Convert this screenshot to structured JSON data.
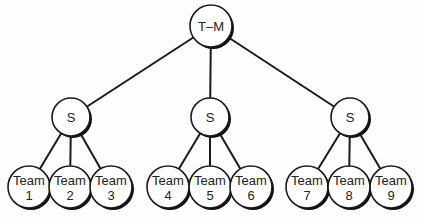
{
  "diagram": {
    "type": "tree",
    "root": {
      "id": "tm",
      "label": "T–M",
      "x": 211,
      "y": 26,
      "r": 21
    },
    "supervisors": [
      {
        "id": "s1",
        "label": "S",
        "x": 71,
        "y": 117,
        "r": 19
      },
      {
        "id": "s2",
        "label": "S",
        "x": 210,
        "y": 117,
        "r": 19
      },
      {
        "id": "s3",
        "label": "S",
        "x": 350,
        "y": 117,
        "r": 19
      }
    ],
    "teams": [
      {
        "id": "t1",
        "line1": "Team",
        "line2": "1",
        "parent": 0,
        "x": 29,
        "y": 187,
        "r": 21
      },
      {
        "id": "t2",
        "line1": "Team",
        "line2": "2",
        "parent": 0,
        "x": 70,
        "y": 187,
        "r": 21
      },
      {
        "id": "t3",
        "line1": "Team",
        "line2": "3",
        "parent": 0,
        "x": 111,
        "y": 187,
        "r": 21
      },
      {
        "id": "t4",
        "line1": "Team",
        "line2": "4",
        "parent": 1,
        "x": 168,
        "y": 187,
        "r": 21
      },
      {
        "id": "t5",
        "line1": "Team",
        "line2": "5",
        "parent": 1,
        "x": 210,
        "y": 187,
        "r": 21
      },
      {
        "id": "t6",
        "line1": "Team",
        "line2": "6",
        "parent": 1,
        "x": 251,
        "y": 187,
        "r": 21
      },
      {
        "id": "t7",
        "line1": "Team",
        "line2": "7",
        "parent": 2,
        "x": 307,
        "y": 187,
        "r": 21
      },
      {
        "id": "t8",
        "line1": "Team",
        "line2": "8",
        "parent": 2,
        "x": 349,
        "y": 187,
        "r": 21
      },
      {
        "id": "t9",
        "line1": "Team",
        "line2": "9",
        "parent": 2,
        "x": 391,
        "y": 187,
        "r": 21
      }
    ]
  }
}
